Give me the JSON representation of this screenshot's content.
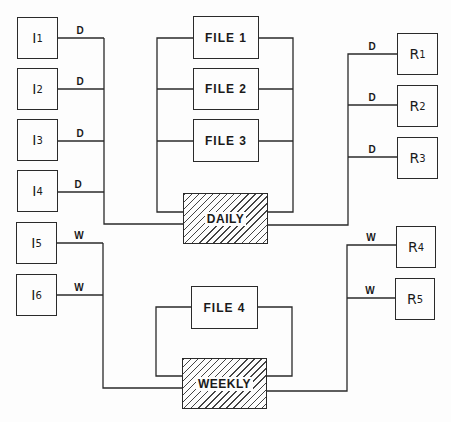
{
  "diagram": {
    "inputs": [
      {
        "id": "I1",
        "letter": "I",
        "sub": "1",
        "link": "D"
      },
      {
        "id": "I2",
        "letter": "I",
        "sub": "2",
        "link": "D"
      },
      {
        "id": "I3",
        "letter": "I",
        "sub": "3",
        "link": "D"
      },
      {
        "id": "I4",
        "letter": "I",
        "sub": "4",
        "link": "D"
      },
      {
        "id": "I5",
        "letter": "I",
        "sub": "5",
        "link": "W"
      },
      {
        "id": "I6",
        "letter": "I",
        "sub": "6",
        "link": "W"
      }
    ],
    "files": [
      {
        "label": "FILE 1"
      },
      {
        "label": "FILE 2"
      },
      {
        "label": "FILE 3"
      },
      {
        "label": "FILE 4"
      }
    ],
    "processes": {
      "daily": "DAILY",
      "weekly": "WEEKLY"
    },
    "reports": [
      {
        "id": "R1",
        "letter": "R",
        "sub": "1",
        "link": "D"
      },
      {
        "id": "R2",
        "letter": "R",
        "sub": "2",
        "link": "D"
      },
      {
        "id": "R3",
        "letter": "R",
        "sub": "3",
        "link": "D"
      },
      {
        "id": "R4",
        "letter": "R",
        "sub": "4",
        "link": "W"
      },
      {
        "id": "R5",
        "letter": "R",
        "sub": "5",
        "link": "W"
      }
    ]
  }
}
